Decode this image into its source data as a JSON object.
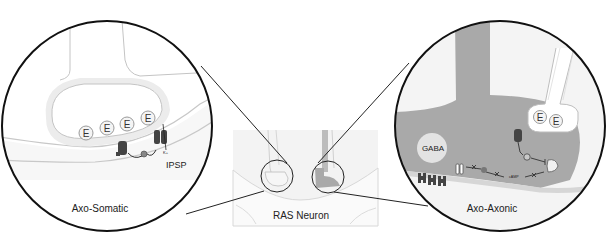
{
  "figure": {
    "center": {
      "label": "RAS Neuron"
    },
    "left_panel": {
      "label": "Axo-Somatic",
      "vesicle_label": "E",
      "vesicle_count": 4,
      "potential_label": "IPSP",
      "ion_label": "K+"
    },
    "right_panel": {
      "label": "Axo-Axonic",
      "vesicle_label": "E",
      "vesicle_count": 2,
      "transmitter_label": "GABA",
      "messenger_label": "cAMP"
    },
    "colors": {
      "outline": "#111111",
      "membrane": "#bdbdbd",
      "light_fill": "#ececec",
      "axon_fill": "#a9a9a9",
      "receptor": "#444444"
    }
  }
}
